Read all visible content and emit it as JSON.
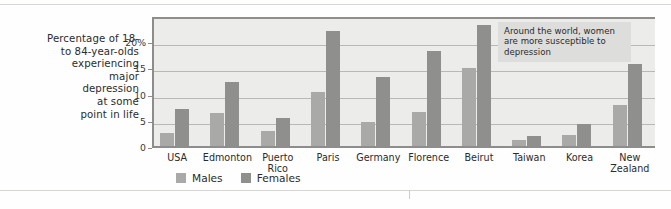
{
  "chart_data": {
    "type": "bar",
    "title": "",
    "subtitle": "",
    "xlabel": "",
    "ylabel": "Percentage of 18- to 84-year-olds experiencing major depression at some point in life",
    "ylim": [
      0,
      25
    ],
    "ytick_values": [
      0,
      5,
      10,
      15,
      20
    ],
    "ytick_labels": [
      "0",
      "5",
      "10",
      "15",
      "20%"
    ],
    "grid": true,
    "legend_position": "bottom-left",
    "categories": [
      "USA",
      "Edmonton",
      "Puerto Rico",
      "Paris",
      "Germany",
      "Florence",
      "Beirut",
      "Taiwan",
      "Korea",
      "New Zealand"
    ],
    "series": [
      {
        "name": "Males",
        "color": "#a9a9a7",
        "values": [
          2.8,
          6.6,
          3.3,
          10.7,
          5.0,
          6.8,
          15.2,
          1.5,
          2.5,
          8.2
        ]
      },
      {
        "name": "Females",
        "color": "#8f8f8d",
        "values": [
          7.4,
          12.6,
          5.7,
          22.3,
          13.5,
          18.5,
          23.5,
          2.3,
          4.5,
          16.0
        ]
      }
    ],
    "annotations": [
      {
        "text": "Around the world, women are more susceptible to depression"
      }
    ]
  },
  "caption": {
    "line1": "Percentage of 18-",
    "line2": "to 84-year-olds",
    "line3": "experiencing",
    "line4": "major",
    "line5": "depression",
    "line6": "at some",
    "line7": "point in life"
  },
  "categories_display": [
    {
      "line1": "USA",
      "line2": ""
    },
    {
      "line1": "Edmonton",
      "line2": ""
    },
    {
      "line1": "Puerto",
      "line2": "Rico"
    },
    {
      "line1": "Paris",
      "line2": ""
    },
    {
      "line1": "Germany",
      "line2": ""
    },
    {
      "line1": "Florence",
      "line2": ""
    },
    {
      "line1": "Beirut",
      "line2": ""
    },
    {
      "line1": "Taiwan",
      "line2": ""
    },
    {
      "line1": "Korea",
      "line2": ""
    },
    {
      "line1": "New",
      "line2": "Zealand"
    }
  ],
  "annotation_text": "Around the world, women are more susceptible to depression",
  "legend": {
    "males": "Males",
    "females": "Females"
  },
  "colors": {
    "male_bar": "#a9a9a7",
    "female_bar": "#8f8f8d",
    "plot_background": "#ececeb",
    "axis": "#8e8d8b",
    "gridline": "#b9b8b6",
    "annotation_background": "#dddddc"
  }
}
